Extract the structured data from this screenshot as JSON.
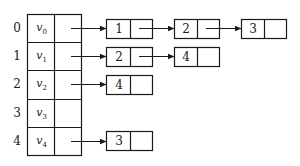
{
  "diagram": {
    "type": "adjacency-list",
    "vertex_table": {
      "rows": [
        {
          "index": "0",
          "vertex": "v",
          "subscript": "0"
        },
        {
          "index": "1",
          "vertex": "v",
          "subscript": "1"
        },
        {
          "index": "2",
          "vertex": "v",
          "subscript": "2"
        },
        {
          "index": "3",
          "vertex": "v",
          "subscript": "3"
        },
        {
          "index": "4",
          "vertex": "v",
          "subscript": "4"
        }
      ]
    },
    "adjacency": [
      {
        "row": 0,
        "nodes": [
          "1",
          "2",
          "3"
        ]
      },
      {
        "row": 1,
        "nodes": [
          "2",
          "4"
        ]
      },
      {
        "row": 2,
        "nodes": [
          "4"
        ]
      },
      {
        "row": 3,
        "nodes": []
      },
      {
        "row": 4,
        "nodes": [
          "3"
        ]
      }
    ],
    "colors": {
      "stroke": "#1a1a1a",
      "background": "#ffffff"
    }
  }
}
